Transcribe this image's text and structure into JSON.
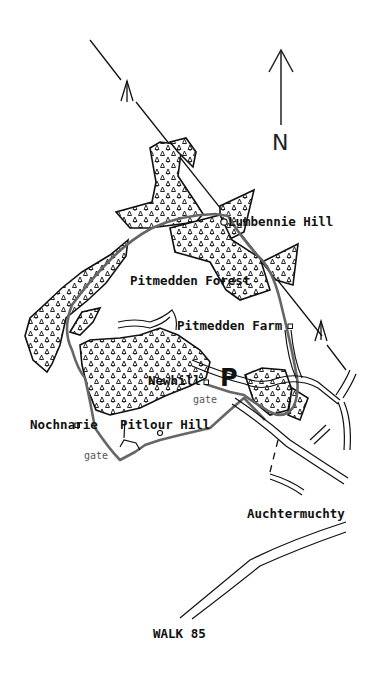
{
  "map": {
    "title": "WALK 85",
    "north_label": "N",
    "parking_label": "P",
    "colors": {
      "ink": "#111111",
      "route": "#666666",
      "background": "#ffffff"
    },
    "places": [
      {
        "id": "lumbennie-hill",
        "label": "Lumbennie Hill",
        "symbol": "summit-circle"
      },
      {
        "id": "pitmedden-forest",
        "label": "Pitmedden Forest",
        "symbol": "none"
      },
      {
        "id": "pitmedden-farm",
        "label": "Pitmedden Farm",
        "symbol": "building-square"
      },
      {
        "id": "newhill",
        "label": "Newhill",
        "symbol": "building-square"
      },
      {
        "id": "nochnarie",
        "label": "Nochnarie",
        "symbol": "building-square"
      },
      {
        "id": "pitlour-hill",
        "label": "Pitlour Hill",
        "symbol": "summit-circle"
      },
      {
        "id": "auchtermuchty",
        "label": "Auchtermuchty",
        "symbol": "none"
      }
    ],
    "gates": [
      "gate",
      "gate"
    ],
    "icons": [
      "north-arrow-icon",
      "parking-icon",
      "direction-arrow-icon",
      "tree-icon"
    ]
  }
}
